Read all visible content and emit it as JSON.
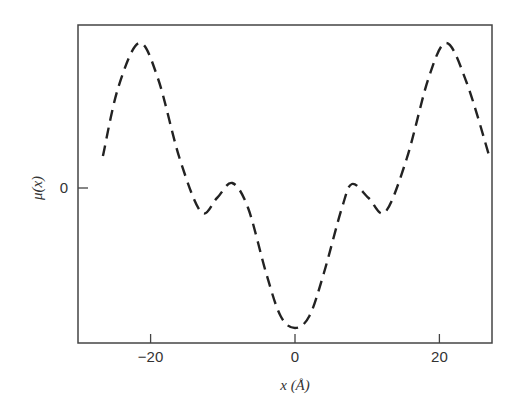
{
  "chart_data": {
    "type": "line",
    "title": "",
    "xlabel": "x (Å)",
    "ylabel": "μ(x)",
    "xlim": [
      -30,
      27.3
    ],
    "ylim": [
      -1.55,
      1.65
    ],
    "x_ticks": [
      -20,
      0,
      20
    ],
    "x_tick_labels": [
      "-20",
      "0",
      "20"
    ],
    "y_ticks": [
      0
    ],
    "y_tick_labels": [
      "0"
    ],
    "grid": false,
    "legend": null,
    "line_style": "dashed",
    "series": [
      {
        "name": "μ(x)",
        "x": [
          -26.6,
          -24.5,
          -21.6,
          -19.0,
          -16.0,
          -13.0,
          -10.8,
          -8.7,
          -6.5,
          -4.0,
          -2.0,
          0,
          2.0,
          4.0,
          6.5,
          7.9,
          10.2,
          12.5,
          15.5,
          18.5,
          21.0,
          23.8,
          26.9
        ],
        "y": [
          0.32,
          1.0,
          1.45,
          1.1,
          0.3,
          -0.24,
          -0.1,
          0.05,
          -0.2,
          -0.85,
          -1.28,
          -1.4,
          -1.28,
          -0.85,
          -0.2,
          0.04,
          -0.1,
          -0.24,
          0.3,
          1.1,
          1.45,
          1.05,
          0.32
        ]
      }
    ]
  },
  "labels": {
    "xlabel": "x (Å)",
    "ylabel": "μ(x)",
    "y_zero": "0",
    "x_ticks": [
      "-20",
      "0",
      "20"
    ]
  }
}
